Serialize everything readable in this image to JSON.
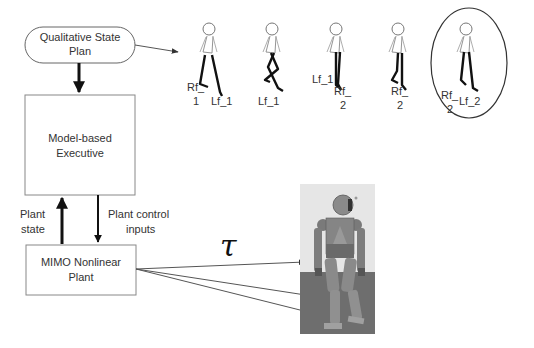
{
  "diagram": {
    "nodes": {
      "plan": {
        "line1": "Qualitative State",
        "line2": "Plan"
      },
      "executive": {
        "line1": "Model-based",
        "line2": "Executive"
      },
      "plant": {
        "line1": "MIMO Nonlinear",
        "line2": "Plant"
      }
    },
    "edges": {
      "plant_state": {
        "line1": "Plant",
        "line2": "state"
      },
      "control_inputs": {
        "line1": "Plant control",
        "line2": "inputs"
      },
      "torque_symbol": "τ"
    },
    "gait_frames": [
      {
        "labels": [
          {
            "l1": "Rf_",
            "l2": "1"
          },
          {
            "l1": "Lf_1",
            "l2": ""
          }
        ],
        "highlighted": false
      },
      {
        "labels": [
          {
            "l1": "Lf_1",
            "l2": ""
          }
        ],
        "highlighted": false
      },
      {
        "labels": [
          {
            "l1": "Lf_1",
            "l2": ""
          },
          {
            "l1": "Rf_",
            "l2": "2"
          }
        ],
        "highlighted": false
      },
      {
        "labels": [
          {
            "l1": "Rf_",
            "l2": "2"
          }
        ],
        "highlighted": false
      },
      {
        "labels": [
          {
            "l1": "Rf_",
            "l2": "2"
          },
          {
            "l1": "Lf_2",
            "l2": ""
          }
        ],
        "highlighted": true
      }
    ],
    "robot_image": "humanoid-robot-render"
  }
}
